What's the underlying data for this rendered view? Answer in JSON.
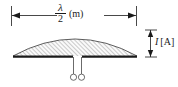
{
  "figure": {
    "background_color": "#ffffff",
    "line_color": "#1a1a1a",
    "hatch_color": "#8c8c8c",
    "fill_color": "#f2f2f2"
  },
  "horizontal_dimension": {
    "name": "length-dimension",
    "numerator": "λ",
    "denominator": "2",
    "unit": "(m)",
    "full_text": "λ/2 (m)"
  },
  "vertical_dimension": {
    "name": "current-dimension",
    "symbol": "I",
    "unit": "[A]",
    "full_text": "I [A]"
  },
  "elements": {
    "dome_label": "current-distribution-envelope",
    "baseline_label": "dipole-conductor",
    "feed_label": "feed-terminals",
    "left_arrow": "arrow-left",
    "right_arrow": "arrow-right",
    "up_arrow": "arrow-up",
    "down_arrow": "arrow-down"
  }
}
